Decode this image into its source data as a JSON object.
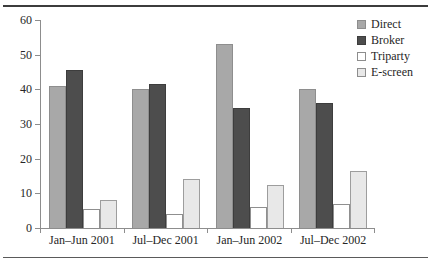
{
  "chart_data": {
    "type": "bar",
    "title": "",
    "xlabel": "",
    "ylabel": "",
    "categories": [
      "Jan–Jun 2001",
      "Jul–Dec 2001",
      "Jan–Jun 2002",
      "Jul–Dec 2002"
    ],
    "series": [
      {
        "name": "Direct",
        "color": "#a8a8a8",
        "values": [
          41,
          40,
          53,
          40
        ]
      },
      {
        "name": "Broker",
        "color": "#4d4d4d",
        "values": [
          45.5,
          41.5,
          34.5,
          36
        ]
      },
      {
        "name": "Triparty",
        "color": "#ffffff",
        "values": [
          5.5,
          4,
          6,
          7
        ]
      },
      {
        "name": "E-screen",
        "color": "#e8e8e8",
        "values": [
          8,
          14,
          12.5,
          16.5
        ]
      }
    ],
    "ylim": [
      0,
      60
    ],
    "yticks": [
      0,
      10,
      20,
      30,
      40,
      50,
      60
    ],
    "ytick_labels": [
      "0",
      "10",
      "20",
      "30",
      "40",
      "50",
      "60"
    ],
    "grid": false,
    "legend_position": "top-right"
  }
}
